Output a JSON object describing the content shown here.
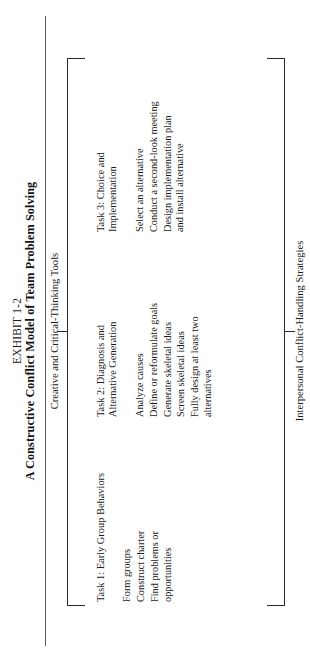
{
  "title": {
    "kicker": "EXHIBIT 1-2",
    "main": "A Constructive Conflict Model of Team Problem Solving"
  },
  "labels": {
    "top": "Creative and Critical-Thinking Tools",
    "bottom": "Interpersonal Conflict-Handling Strategies"
  },
  "tasks": [
    {
      "head": "Task 1:  Early Group Behaviors",
      "items": [
        "Form groups",
        "Construct charter",
        "Find problems or\nopportunities"
      ]
    },
    {
      "head": "Task 2:  Diagnosis and\n             Alternative Generation",
      "items": [
        "Analyze causes",
        "Define or reformulate goals",
        "Generate skeletal ideas",
        "Screen skeletal ideas",
        "Fully design at least two\nalternatives"
      ]
    },
    {
      "head": "Task 3:  Choice and\n             Implementation",
      "items": [
        "Select an alternative",
        "Conduct a second-look meeting",
        "Design implementation plan\nand install alternative"
      ]
    }
  ]
}
